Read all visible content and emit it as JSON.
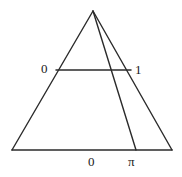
{
  "figure": {
    "type": "geometric-diagram",
    "background_color": "#ffffff",
    "stroke_color": "#2b2b2b",
    "stroke_width": 1.4,
    "canvas": {
      "width": 182,
      "height": 177
    },
    "geometry": {
      "triangle": {
        "name": "outer-triangle",
        "apex": {
          "x": 93,
          "y": 11
        },
        "base_left": {
          "x": 12,
          "y": 150
        },
        "base_right": {
          "x": 172,
          "y": 150
        }
      },
      "cevian": {
        "name": "apex-to-base-segment",
        "from": {
          "x": 93,
          "y": 11
        },
        "to": {
          "x": 136,
          "y": 150
        }
      },
      "chord": {
        "name": "horizontal-chord",
        "from": {
          "x": 56,
          "y": 70
        },
        "to": {
          "x": 131,
          "y": 70
        }
      }
    },
    "labels": {
      "left_zero": "0",
      "right_one": "1",
      "base_zero": "0",
      "base_pi": "π"
    }
  }
}
